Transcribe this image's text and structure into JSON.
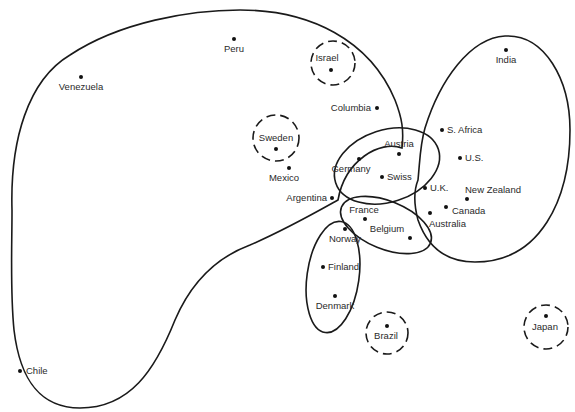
{
  "diagram": {
    "type": "cluster-map",
    "background": "#ffffff",
    "stroke_color": "#1a1a1a",
    "countries": [
      {
        "id": "peru",
        "label": "Peru",
        "x": 234,
        "y": 39
      },
      {
        "id": "venezuela",
        "label": "Venezuela",
        "x": 81,
        "y": 77
      },
      {
        "id": "israel",
        "label": "Israel",
        "x": 331,
        "y": 70
      },
      {
        "id": "sweden",
        "label": "Sweden",
        "x": 276,
        "y": 149
      },
      {
        "id": "mexico",
        "label": "Mexico",
        "x": 289,
        "y": 168
      },
      {
        "id": "columbia",
        "label": "Columbia",
        "x": 377,
        "y": 108
      },
      {
        "id": "argentina",
        "label": "Argentina",
        "x": 332,
        "y": 198
      },
      {
        "id": "chile",
        "label": "Chile",
        "x": 20,
        "y": 371
      },
      {
        "id": "austria",
        "label": "Austria",
        "x": 399,
        "y": 154
      },
      {
        "id": "germany",
        "label": "Germany",
        "x": 359,
        "y": 159
      },
      {
        "id": "swiss",
        "label": "Swiss",
        "x": 382,
        "y": 177
      },
      {
        "id": "india",
        "label": "India",
        "x": 506,
        "y": 50
      },
      {
        "id": "s-africa",
        "label": "S. Africa",
        "x": 442,
        "y": 130
      },
      {
        "id": "us",
        "label": "U.S.",
        "x": 460,
        "y": 158
      },
      {
        "id": "uk",
        "label": "U.K.",
        "x": 425,
        "y": 188
      },
      {
        "id": "new-zealand",
        "label": "New Zealand",
        "x": 467,
        "y": 199
      },
      {
        "id": "canada",
        "label": "Canada",
        "x": 446,
        "y": 207
      },
      {
        "id": "australia",
        "label": "Australia",
        "x": 430,
        "y": 213
      },
      {
        "id": "france",
        "label": "France",
        "x": 365,
        "y": 219
      },
      {
        "id": "belgium",
        "label": "Belgium",
        "x": 410,
        "y": 238
      },
      {
        "id": "norway",
        "label": "Norway",
        "x": 345,
        "y": 229
      },
      {
        "id": "finland",
        "label": "Finland",
        "x": 323,
        "y": 267
      },
      {
        "id": "denmark",
        "label": "Denmark",
        "x": 335,
        "y": 296
      },
      {
        "id": "brazil",
        "label": "Brazil",
        "x": 387,
        "y": 326
      },
      {
        "id": "japan",
        "label": "Japan",
        "x": 546,
        "y": 316
      }
    ],
    "clusters": [
      {
        "id": "latin-large",
        "style": "solid",
        "members": [
          "Peru",
          "Venezuela",
          "Columbia",
          "Mexico",
          "Argentina",
          "Chile"
        ]
      },
      {
        "id": "germanic",
        "style": "solid",
        "members": [
          "Austria",
          "Germany",
          "Swiss"
        ]
      },
      {
        "id": "anglo",
        "style": "solid",
        "members": [
          "India",
          "S. Africa",
          "U.S.",
          "U.K.",
          "New Zealand",
          "Canada",
          "Australia"
        ]
      },
      {
        "id": "latin-european",
        "style": "solid",
        "members": [
          "France",
          "Belgium"
        ]
      },
      {
        "id": "nordic",
        "style": "solid",
        "members": [
          "Norway",
          "Finland",
          "Denmark"
        ]
      },
      {
        "id": "israel-independent",
        "style": "dashed",
        "members": [
          "Israel"
        ]
      },
      {
        "id": "sweden-independent",
        "style": "dashed",
        "members": [
          "Sweden"
        ]
      },
      {
        "id": "brazil-independent",
        "style": "dashed",
        "members": [
          "Brazil"
        ]
      },
      {
        "id": "japan-independent",
        "style": "dashed",
        "members": [
          "Japan"
        ]
      }
    ]
  }
}
